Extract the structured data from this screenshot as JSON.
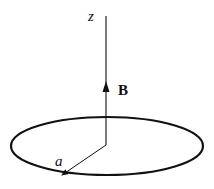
{
  "diagram": {
    "axis_label": "z",
    "field_label": "B",
    "radius_label": "a",
    "colors": {
      "stroke": "#111111",
      "background": "#ffffff"
    }
  }
}
